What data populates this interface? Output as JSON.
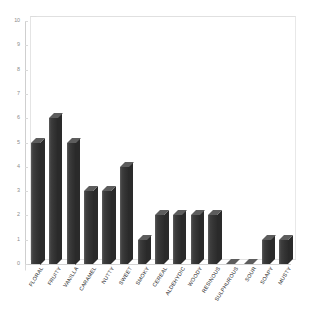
{
  "chart_data": {
    "type": "bar",
    "title": "",
    "subtitle": "",
    "xlabel": "",
    "ylabel": "",
    "ylim": [
      0,
      10
    ],
    "yticks": [
      0,
      1,
      2,
      3,
      4,
      5,
      6,
      7,
      8,
      9,
      10
    ],
    "ytick_labels": [
      "0",
      "1",
      "2",
      "3",
      "4",
      "5",
      "6",
      "7",
      "8",
      "9",
      "10"
    ],
    "grid": false,
    "legend": false,
    "legend_position": "none",
    "style": "3d-column",
    "bar_color": "#3a3a3a",
    "background_color": "#ffffff",
    "axis_color": "#cfcfcf",
    "tick_label_color": "#8b8b8b",
    "category_label_color": "#2b2b2b",
    "category_label_rotation": -58,
    "categories": [
      "FLORAL",
      "FRUITY",
      "VANILLA",
      "CARAMEL",
      "NUTTY",
      "SWEET",
      "SMOKY",
      "CEREAL",
      "ALDEHYDIC",
      "WOODY",
      "RESINOUS",
      "SULPHUROUS",
      "SOUR",
      "SOAPY",
      "MUSTY"
    ],
    "values": [
      5,
      6,
      5,
      3,
      3,
      4,
      1,
      2,
      2,
      2,
      2,
      0,
      0,
      1,
      1
    ],
    "series": [
      {
        "name": "",
        "values": [
          5,
          6,
          5,
          3,
          3,
          4,
          1,
          2,
          2,
          2,
          2,
          0,
          0,
          1,
          1
        ]
      }
    ]
  }
}
